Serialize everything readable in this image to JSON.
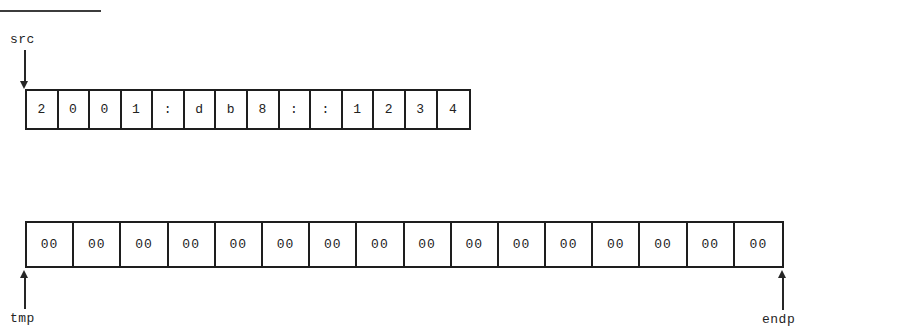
{
  "diagram": {
    "title_rule": "",
    "pointers": {
      "src": {
        "label": "src",
        "direction": "down"
      },
      "tmp": {
        "label": "tmp",
        "direction": "up"
      },
      "endp": {
        "label": "endp",
        "direction": "up"
      }
    },
    "rows": [
      {
        "name": "src-buffer",
        "cell_count": 14,
        "cells": [
          "2",
          "0",
          "0",
          "1",
          ":",
          "d",
          "b",
          "8",
          ":",
          ":",
          "1",
          "2",
          "3",
          "4"
        ]
      },
      {
        "name": "tmp-buffer",
        "cell_count": 16,
        "cells": [
          "00",
          "00",
          "00",
          "00",
          "00",
          "00",
          "00",
          "00",
          "00",
          "00",
          "00",
          "00",
          "00",
          "00",
          "00",
          "00"
        ]
      }
    ],
    "colors": {
      "ink": "#1e1e1e",
      "background": "#ffffff"
    }
  }
}
